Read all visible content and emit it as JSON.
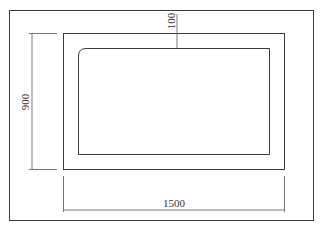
{
  "drawing": {
    "type": "technical-drawing",
    "units": "mm",
    "dimensions": {
      "height": "900",
      "width": "1500",
      "wall_thickness": "100"
    },
    "colors": {
      "line": "#3a3a3a",
      "background": "#ffffff"
    }
  }
}
